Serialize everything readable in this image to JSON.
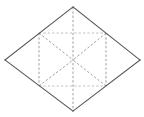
{
  "figure": {
    "title": "Rhombus subdivided into triangles",
    "type": "geometry-diagram",
    "caption": "",
    "canvas": {
      "width": 144,
      "height": 117,
      "background": "#ffffff"
    },
    "colors": {
      "outline": "#555555",
      "dashed": "#9a9a9a",
      "dashed_faint": "#b4b4b4",
      "face": "#ffffff"
    },
    "vertices": {
      "top": {
        "label": "top",
        "x": 73,
        "y": 7
      },
      "left": {
        "label": "left",
        "x": 5,
        "y": 60
      },
      "right": {
        "label": "right",
        "x": 140,
        "y": 60
      },
      "bottom": {
        "label": "bottom",
        "x": 73,
        "y": 111
      },
      "upper_left": {
        "label": "upper-left",
        "x": 39,
        "y": 33
      },
      "upper_right": {
        "label": "upper-right",
        "x": 106,
        "y": 33
      },
      "lower_left": {
        "label": "lower-left",
        "x": 39,
        "y": 86
      },
      "lower_right": {
        "label": "lower-right",
        "x": 106,
        "y": 86
      },
      "center": {
        "label": "center",
        "x": 73,
        "y": 60
      }
    },
    "outline_path": "M 73 7 L 140 60 L 73 111 L 5 60 Z",
    "solid_edges": [
      {
        "name": "edge-top-right",
        "d": "M 73 7 L 140 60"
      },
      {
        "name": "edge-right-bottom",
        "d": "M 140 60 L 73 111"
      },
      {
        "name": "edge-bottom-left",
        "d": "M 73 111 L 5 60"
      },
      {
        "name": "edge-left-top",
        "d": "M 5 60 L 73 7"
      }
    ],
    "dashed_lines": [
      {
        "name": "vertical-median",
        "d": "M 73 7 L 73 111"
      },
      {
        "name": "vertical-chord-left",
        "d": "M 39 33 L 39 86"
      },
      {
        "name": "vertical-chord-right",
        "d": "M 106 33 L 106 86"
      },
      {
        "name": "diagonal-ul-center",
        "d": "M 39 33 L 73 60"
      },
      {
        "name": "diagonal-ur-center",
        "d": "M 106 33 L 73 60"
      },
      {
        "name": "diagonal-ll-center",
        "d": "M 39 86 L 73 60"
      },
      {
        "name": "diagonal-lr-center",
        "d": "M 106 86 L 73 60"
      },
      {
        "name": "diagonal-center-left",
        "d": "M 73 60 L 39 86"
      },
      {
        "name": "diagonal-center-right",
        "d": "M 73 60 L 106 86"
      }
    ],
    "faint_dashed_lines": [
      {
        "name": "upper-horizontal-chord",
        "d": "M 39 33 L 106 33"
      },
      {
        "name": "lower-horizontal-chord",
        "d": "M 39 86 L 106 86"
      }
    ],
    "counts": {
      "outer_vertices": 4,
      "interior_points": 5,
      "triangular_regions": 6
    }
  }
}
